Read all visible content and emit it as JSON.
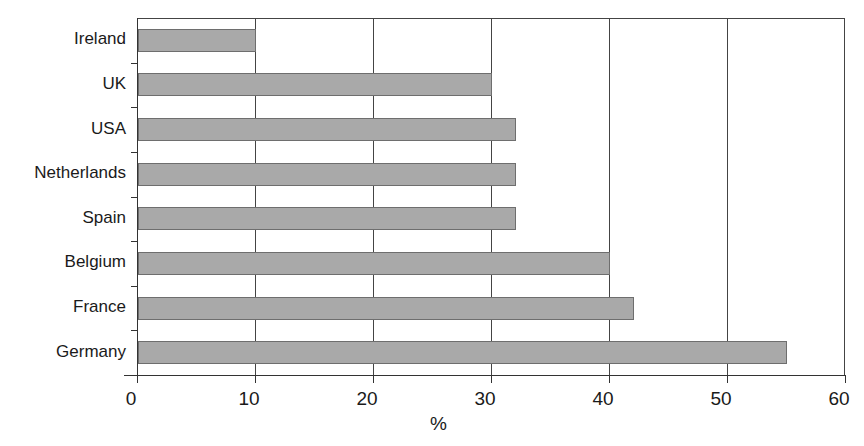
{
  "chart_data": {
    "type": "bar",
    "orientation": "horizontal",
    "title": "",
    "xlabel": "%",
    "ylabel": "",
    "categories": [
      "Ireland",
      "UK",
      "USA",
      "Netherlands",
      "Spain",
      "Belgium",
      "France",
      "Germany"
    ],
    "values": [
      10,
      30,
      32,
      32,
      32,
      40,
      42,
      55
    ],
    "xlim": [
      0,
      60
    ],
    "xticks": [
      "0",
      "10",
      "20",
      "30",
      "40",
      "50",
      "60"
    ],
    "grid": {
      "vertical": true,
      "horizontal": false
    },
    "legend": null,
    "colors": {
      "bar_fill": "#a9a9a9",
      "bar_edge": "#6e6e6e",
      "grid": "#444444"
    }
  }
}
